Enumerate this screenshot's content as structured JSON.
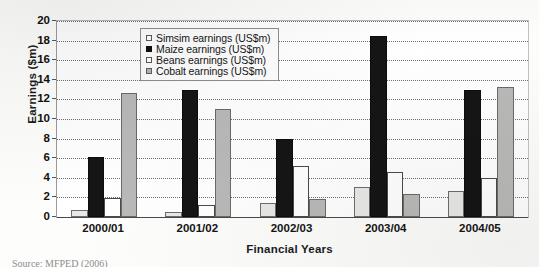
{
  "chart_data": {
    "type": "bar",
    "title": "",
    "xlabel": "Financial Years",
    "ylabel": "Earnings ($m)",
    "ylim": [
      0,
      20
    ],
    "ytick_step": 2,
    "yticks": [
      "20",
      "18",
      "16",
      "14",
      "12",
      "10",
      "8",
      "6",
      "4",
      "2",
      "0"
    ],
    "grid": true,
    "grid_style": "dotted-horizontal",
    "legend_position": "top-center-inside",
    "categories": [
      "2000/01",
      "2001/02",
      "2002/03",
      "2003/04",
      "2004/05"
    ],
    "series": [
      {
        "name": "Simsim earnings (US$m)",
        "key": "simsim",
        "color": "#e8e8e6",
        "values": [
          0.7,
          0.5,
          1.4,
          3.1,
          2.7
        ]
      },
      {
        "name": "Maize earnings (US$m)",
        "key": "maize",
        "color": "#151515",
        "values": [
          6.1,
          13.0,
          8.0,
          18.5,
          13.0
        ]
      },
      {
        "name": "Beans earnings (US$m)",
        "key": "beans",
        "color": "#ffffff",
        "values": [
          1.9,
          1.2,
          5.2,
          4.6,
          4.0
        ]
      },
      {
        "name": "Cobalt earnings (US$m)",
        "key": "cobalt",
        "color": "#b9b9b7",
        "values": [
          12.7,
          11.0,
          1.8,
          2.3,
          13.3
        ]
      }
    ]
  },
  "caption": {
    "text": "Source: MFPED (2006)"
  }
}
